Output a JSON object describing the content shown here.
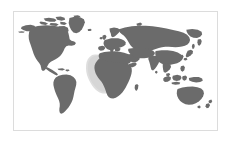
{
  "figure": {
    "type": "world-map-thumbnail",
    "canvas": {
      "width": 232,
      "height": 142,
      "background_color": "#ffffff"
    },
    "frame": {
      "label": "map border",
      "left": 13,
      "top": 11,
      "width": 205,
      "height": 120,
      "border_color": "#dcdcdc",
      "border_width": 1,
      "fill_color": "#ffffff"
    },
    "projection": "equirectangular",
    "extent": {
      "lon_min": -180,
      "lon_max": 180,
      "lat_min": -60,
      "lat_max": 84
    },
    "layers": [
      {
        "name": "ocean",
        "color": "#ffffff"
      },
      {
        "name": "land",
        "color": "#6b6b6b"
      },
      {
        "name": "highlight",
        "color": "#c9c9c9"
      }
    ],
    "landmasses": [
      "North America",
      "Greenland",
      "South America",
      "Europe",
      "Africa",
      "Asia",
      "Australia",
      "Indonesia",
      "Japan",
      "New Zealand",
      "Madagascar",
      "British Isles",
      "Iceland"
    ],
    "omitted_landmasses": [
      "Antarctica"
    ],
    "highlight": {
      "label": "West Africa / Gulf of Guinea",
      "color": "#c9c9c9",
      "center_lon": -5,
      "center_lat": 7
    },
    "labels": [],
    "legend": null,
    "graticule": false
  }
}
